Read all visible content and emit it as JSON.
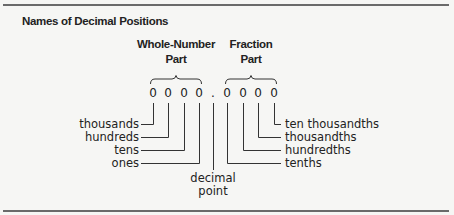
{
  "figure": {
    "title": "Names of Decimal Positions",
    "whole_header": [
      "Whole-Number",
      "Part"
    ],
    "fraction_header": [
      "Fraction",
      "Part"
    ],
    "number": {
      "whole_digits": [
        "0",
        "0",
        "0",
        "0"
      ],
      "decimal_point": ".",
      "fraction_digits": [
        "0",
        "0",
        "0",
        "0"
      ]
    },
    "whole_labels": [
      "thousands",
      "hundreds",
      "tens",
      "ones"
    ],
    "fraction_labels": [
      "ten thousandths",
      "thousandths",
      "hundredths",
      "tenths"
    ],
    "decimal_point_label": [
      "decimal",
      "point"
    ]
  },
  "colors": {
    "background": "#f6f6f4",
    "text": "#222222",
    "rule": "#6a6a6a"
  }
}
